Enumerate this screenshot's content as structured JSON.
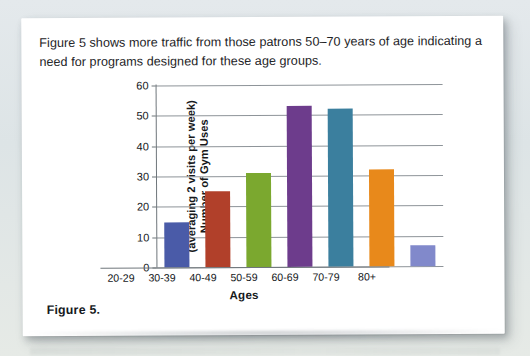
{
  "page": {
    "background_color": "#dfe5e8",
    "card_color": "#ffffff"
  },
  "intro_text": "Figure 5 shows more traffic from those patrons 50–70 years of age indicating a need for programs designed for these age groups.",
  "figure_caption": "Figure 5.",
  "chart_data": {
    "type": "bar",
    "title": "",
    "categories": [
      "20-29",
      "30-39",
      "40-49",
      "50-59",
      "60-69",
      "70-79",
      "80+"
    ],
    "values": [
      15,
      25,
      31,
      53,
      52,
      32,
      7
    ],
    "colors": [
      "#4a5ba8",
      "#b1402a",
      "#7ba82f",
      "#6d3c8c",
      "#3b7f9e",
      "#e8891b",
      "#8189cb"
    ],
    "xlabel": "Ages",
    "ylabel_line1": "Number of Gym Uses",
    "ylabel_line2": "(averaging 2 visits per week)",
    "ylim": [
      0,
      60
    ],
    "yticks": [
      0,
      10,
      20,
      30,
      40,
      50,
      60
    ],
    "ytick_labels": [
      "0",
      "10",
      "20",
      "30",
      "40",
      "50",
      "60"
    ],
    "grid": true,
    "grid_color": "#8e9499",
    "legend": false,
    "legend_position": "none"
  }
}
